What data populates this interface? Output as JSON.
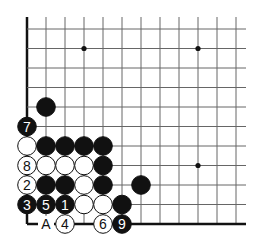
{
  "diagram": {
    "type": "go-board-fragment",
    "grid": {
      "cols": 12,
      "rows": 11,
      "origin_x": 27,
      "bottom_y": 224,
      "step_x": 19,
      "step_y": 19.5,
      "extend_right": 10,
      "extend_top": 12,
      "line_color": "#666666",
      "edge_color": "#111111"
    },
    "star_points": [
      {
        "col": 3,
        "row": 9
      },
      {
        "col": 9,
        "row": 9
      },
      {
        "col": 9,
        "row": 3
      }
    ],
    "stones": [
      {
        "col": 1,
        "row": 6,
        "color": "black",
        "label": ""
      },
      {
        "col": 0,
        "row": 5,
        "color": "black",
        "label": "7"
      },
      {
        "col": 0,
        "row": 4,
        "color": "white",
        "label": ""
      },
      {
        "col": 1,
        "row": 4,
        "color": "black",
        "label": ""
      },
      {
        "col": 2,
        "row": 4,
        "color": "black",
        "label": ""
      },
      {
        "col": 3,
        "row": 4,
        "color": "black",
        "label": ""
      },
      {
        "col": 4,
        "row": 4,
        "color": "black",
        "label": ""
      },
      {
        "col": 0,
        "row": 3,
        "color": "white",
        "label": "8"
      },
      {
        "col": 1,
        "row": 3,
        "color": "white",
        "label": ""
      },
      {
        "col": 2,
        "row": 3,
        "color": "white",
        "label": ""
      },
      {
        "col": 3,
        "row": 3,
        "color": "white",
        "label": ""
      },
      {
        "col": 4,
        "row": 3,
        "color": "black",
        "label": ""
      },
      {
        "col": 0,
        "row": 2,
        "color": "white",
        "label": "2"
      },
      {
        "col": 1,
        "row": 2,
        "color": "black",
        "label": ""
      },
      {
        "col": 2,
        "row": 2,
        "color": "black",
        "label": ""
      },
      {
        "col": 3,
        "row": 2,
        "color": "white",
        "label": ""
      },
      {
        "col": 4,
        "row": 2,
        "color": "black",
        "label": ""
      },
      {
        "col": 6,
        "row": 2,
        "color": "black",
        "label": ""
      },
      {
        "col": 0,
        "row": 1,
        "color": "black",
        "label": "3"
      },
      {
        "col": 1,
        "row": 1,
        "color": "black",
        "label": "5"
      },
      {
        "col": 2,
        "row": 1,
        "color": "black",
        "label": "1"
      },
      {
        "col": 3,
        "row": 1,
        "color": "white",
        "label": ""
      },
      {
        "col": 4,
        "row": 1,
        "color": "white",
        "label": ""
      },
      {
        "col": 5,
        "row": 1,
        "color": "black",
        "label": ""
      },
      {
        "col": 2,
        "row": 0,
        "color": "white",
        "label": "4"
      },
      {
        "col": 4,
        "row": 0,
        "color": "white",
        "label": "6"
      },
      {
        "col": 5,
        "row": 0,
        "color": "black",
        "label": "9"
      }
    ],
    "point_labels": [
      {
        "col": 1,
        "row": 0,
        "text": "A"
      }
    ]
  }
}
